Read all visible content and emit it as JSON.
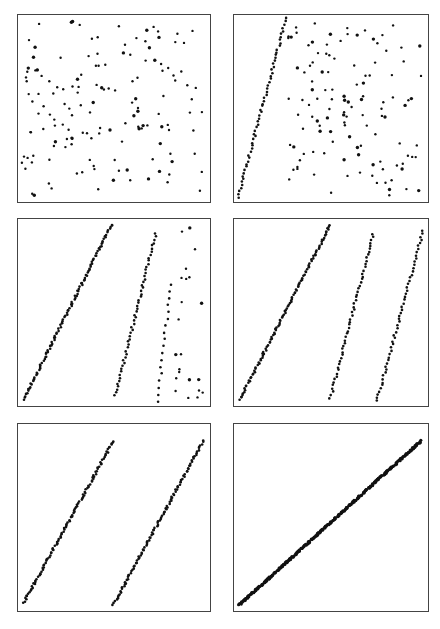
{
  "figure": {
    "caption": "",
    "point_color": "#111111",
    "border_color": "#444444"
  },
  "chart_data": [
    {
      "type": "scatter",
      "panel": "top-left",
      "title": "",
      "xlabel": "",
      "ylabel": "",
      "xlim": [
        0,
        1
      ],
      "ylim": [
        0,
        1
      ],
      "grid": false,
      "description": "Uniformly random scattered points",
      "series": [
        {
          "name": "points",
          "pattern": "random",
          "count": 150,
          "seed": 11
        }
      ]
    },
    {
      "type": "scatter",
      "panel": "top-right",
      "xlim": [
        0,
        1
      ],
      "ylim": [
        0,
        1
      ],
      "grid": false,
      "description": "Random points plus one steep diagonal band emerging on the left",
      "series": [
        {
          "name": "band-1",
          "pattern": "line",
          "x0": 0.02,
          "y0": 0.02,
          "x1": 0.27,
          "y1": 0.98,
          "count": 60
        },
        {
          "name": "points",
          "pattern": "random",
          "count": 120,
          "seed": 12,
          "xmin": 0.28
        }
      ]
    },
    {
      "type": "scatter",
      "panel": "middle-left",
      "xlim": [
        0,
        1
      ],
      "ylim": [
        0,
        1
      ],
      "grid": false,
      "description": "Two diagonal bands with scattered points on right",
      "series": [
        {
          "name": "band-1",
          "pattern": "line",
          "x0": 0.03,
          "y0": 0.03,
          "x1": 0.49,
          "y1": 0.97,
          "count": 110
        },
        {
          "name": "band-2",
          "pattern": "line",
          "x0": 0.51,
          "y0": 0.05,
          "x1": 0.72,
          "y1": 0.92,
          "count": 55
        },
        {
          "name": "band-3-partial",
          "pattern": "line",
          "x0": 0.73,
          "y0": 0.02,
          "x1": 0.8,
          "y1": 0.65,
          "count": 18
        },
        {
          "name": "points",
          "pattern": "random",
          "count": 22,
          "seed": 13,
          "xmin": 0.8
        }
      ]
    },
    {
      "type": "scatter",
      "panel": "middle-right",
      "xlim": [
        0,
        1
      ],
      "ylim": [
        0,
        1
      ],
      "grid": false,
      "description": "Three parallel-ish diagonal bands",
      "series": [
        {
          "name": "band-1",
          "pattern": "line",
          "x0": 0.03,
          "y0": 0.03,
          "x1": 0.5,
          "y1": 0.97,
          "count": 110
        },
        {
          "name": "band-2",
          "pattern": "line",
          "x0": 0.5,
          "y0": 0.04,
          "x1": 0.72,
          "y1": 0.92,
          "count": 55
        },
        {
          "name": "band-3",
          "pattern": "line",
          "x0": 0.74,
          "y0": 0.02,
          "x1": 0.98,
          "y1": 0.94,
          "count": 55
        }
      ]
    },
    {
      "type": "scatter",
      "panel": "bottom-left",
      "xlim": [
        0,
        1
      ],
      "ylim": [
        0,
        1
      ],
      "grid": false,
      "description": "Two parallel diagonal bands",
      "series": [
        {
          "name": "band-1",
          "pattern": "line",
          "x0": 0.03,
          "y0": 0.04,
          "x1": 0.5,
          "y1": 0.91,
          "count": 110
        },
        {
          "name": "band-2",
          "pattern": "line",
          "x0": 0.5,
          "y0": 0.03,
          "x1": 0.97,
          "y1": 0.91,
          "count": 110
        }
      ]
    },
    {
      "type": "scatter",
      "panel": "bottom-right",
      "xlim": [
        0,
        1
      ],
      "ylim": [
        0,
        1
      ],
      "grid": false,
      "description": "Single dense diagonal line from bottom-left to top-right",
      "series": [
        {
          "name": "line",
          "pattern": "line",
          "x0": 0.03,
          "y0": 0.03,
          "x1": 0.97,
          "y1": 0.91,
          "count": 300
        }
      ]
    }
  ]
}
